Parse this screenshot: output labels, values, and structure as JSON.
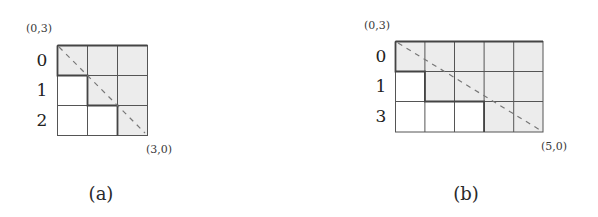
{
  "figure": {
    "panels": [
      {
        "id": "a",
        "caption": "(a)",
        "top_left_label": "(0,3)",
        "bottom_right_label": "(3,0)",
        "rows": 3,
        "cols": 3,
        "row_labels": [
          "0",
          "1",
          "2"
        ],
        "shaded_cells": [
          [
            0,
            0
          ],
          [
            0,
            1
          ],
          [
            0,
            2
          ],
          [
            1,
            1
          ],
          [
            1,
            2
          ],
          [
            2,
            2
          ]
        ],
        "diagonal": "dashed line from top-left to bottom-right"
      },
      {
        "id": "b",
        "caption": "(b)",
        "top_left_label": "(0,3)",
        "bottom_right_label": "(5,0)",
        "rows": 3,
        "cols": 5,
        "row_labels": [
          "0",
          "1",
          "3"
        ],
        "shaded_cells": [
          [
            0,
            0
          ],
          [
            0,
            1
          ],
          [
            0,
            2
          ],
          [
            0,
            3
          ],
          [
            0,
            4
          ],
          [
            1,
            1
          ],
          [
            1,
            2
          ],
          [
            1,
            3
          ],
          [
            1,
            4
          ],
          [
            2,
            3
          ],
          [
            2,
            4
          ]
        ],
        "diagonal": "dashed line from top-left to bottom-right"
      }
    ],
    "colors": {
      "shaded": "#ececec",
      "unshaded": "#ffffff",
      "grid_line": "#555555",
      "dashed_line": "#777777"
    }
  }
}
